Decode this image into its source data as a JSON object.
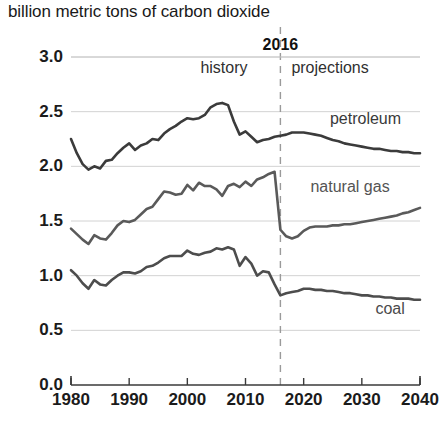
{
  "chart_data": {
    "type": "line",
    "title": "billion metric tons of carbon dioxide",
    "xlabel": "",
    "ylabel": "",
    "xlim": [
      1980,
      2040
    ],
    "ylim": [
      0.0,
      3.0
    ],
    "grid": true,
    "legend_position": "inline-right",
    "x_ticks": [
      "1980",
      "1990",
      "2000",
      "2010",
      "2020",
      "2030",
      "2040"
    ],
    "x_tick_values": [
      1980,
      1990,
      2000,
      2010,
      2020,
      2030,
      2040
    ],
    "y_ticks": [
      "0.0",
      "0.5",
      "1.0",
      "1.5",
      "2.0",
      "2.5",
      "3.0"
    ],
    "y_tick_values": [
      0.0,
      0.5,
      1.0,
      1.5,
      2.0,
      2.5,
      3.0
    ],
    "annotations": {
      "divider_year": "2016",
      "divider_value": 2016,
      "history_label": "history",
      "projections_label": "projections"
    },
    "x": [
      1980,
      1981,
      1982,
      1983,
      1984,
      1985,
      1986,
      1987,
      1988,
      1989,
      1990,
      1991,
      1992,
      1993,
      1994,
      1995,
      1996,
      1997,
      1998,
      1999,
      2000,
      2001,
      2002,
      2003,
      2004,
      2005,
      2006,
      2007,
      2008,
      2009,
      2010,
      2011,
      2012,
      2013,
      2014,
      2015,
      2016,
      2017,
      2018,
      2019,
      2020,
      2021,
      2022,
      2023,
      2024,
      2025,
      2026,
      2027,
      2028,
      2029,
      2030,
      2031,
      2032,
      2033,
      2034,
      2035,
      2036,
      2037,
      2038,
      2039,
      2040
    ],
    "series": [
      {
        "name": "petroleum",
        "color": "#3b3b3b",
        "values": [
          2.25,
          2.12,
          2.02,
          1.97,
          2.0,
          1.98,
          2.05,
          2.06,
          2.12,
          2.17,
          2.21,
          2.15,
          2.19,
          2.21,
          2.25,
          2.24,
          2.3,
          2.34,
          2.37,
          2.41,
          2.44,
          2.43,
          2.44,
          2.47,
          2.54,
          2.57,
          2.58,
          2.56,
          2.41,
          2.29,
          2.32,
          2.27,
          2.22,
          2.24,
          2.25,
          2.27,
          2.28,
          2.29,
          2.31,
          2.31,
          2.31,
          2.3,
          2.29,
          2.28,
          2.26,
          2.24,
          2.23,
          2.21,
          2.2,
          2.19,
          2.18,
          2.17,
          2.16,
          2.16,
          2.15,
          2.14,
          2.14,
          2.13,
          2.13,
          2.12,
          2.12
        ]
      },
      {
        "name": "natural gas",
        "color": "#5a5a5a",
        "values": [
          1.43,
          1.38,
          1.33,
          1.29,
          1.37,
          1.34,
          1.33,
          1.39,
          1.46,
          1.5,
          1.49,
          1.51,
          1.56,
          1.61,
          1.63,
          1.7,
          1.77,
          1.76,
          1.74,
          1.75,
          1.83,
          1.78,
          1.85,
          1.82,
          1.82,
          1.79,
          1.73,
          1.82,
          1.84,
          1.81,
          1.86,
          1.82,
          1.88,
          1.9,
          1.93,
          1.95,
          1.42,
          1.36,
          1.34,
          1.36,
          1.41,
          1.44,
          1.45,
          1.45,
          1.45,
          1.46,
          1.46,
          1.47,
          1.47,
          1.48,
          1.49,
          1.5,
          1.51,
          1.52,
          1.53,
          1.54,
          1.55,
          1.57,
          1.58,
          1.6,
          1.62
        ]
      },
      {
        "name": "coal",
        "color": "#4d4d4d",
        "values": [
          1.05,
          1.0,
          0.93,
          0.88,
          0.96,
          0.92,
          0.91,
          0.96,
          1.0,
          1.03,
          1.03,
          1.02,
          1.04,
          1.08,
          1.09,
          1.12,
          1.16,
          1.18,
          1.18,
          1.18,
          1.23,
          1.2,
          1.19,
          1.21,
          1.22,
          1.25,
          1.24,
          1.26,
          1.24,
          1.09,
          1.17,
          1.11,
          1.0,
          1.04,
          1.03,
          0.92,
          0.82,
          0.84,
          0.85,
          0.86,
          0.88,
          0.88,
          0.87,
          0.87,
          0.86,
          0.86,
          0.85,
          0.84,
          0.84,
          0.83,
          0.82,
          0.82,
          0.81,
          0.81,
          0.8,
          0.8,
          0.79,
          0.79,
          0.79,
          0.78,
          0.78
        ]
      }
    ],
    "series_labels": [
      {
        "name": "petroleum",
        "text": "petroleum"
      },
      {
        "name": "natural gas",
        "text": "natural gas"
      },
      {
        "name": "coal",
        "text": "coal"
      }
    ]
  }
}
